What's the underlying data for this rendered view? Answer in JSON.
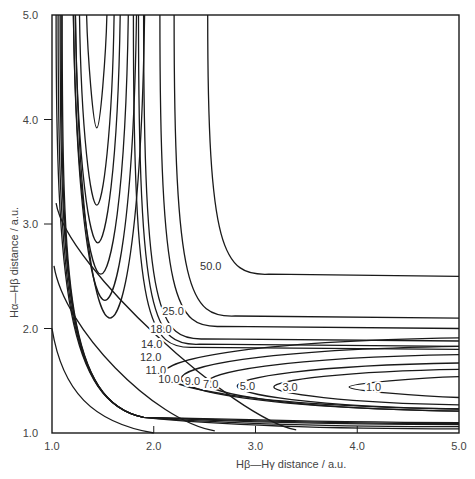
{
  "chart_data": {
    "type": "contour",
    "title": "",
    "xlabel": "Hβ—Hγ distance / a.u.",
    "ylabel": "Hα—Hβ distance / a.u.",
    "xlim": [
      1.0,
      5.0
    ],
    "ylim": [
      1.0,
      5.0
    ],
    "grid": false,
    "legend": "none",
    "x_ticks": [
      "1.0",
      "2.0",
      "3.0",
      "4.0",
      "5.0"
    ],
    "y_ticks": [
      "1.0",
      "2.0",
      "3.0",
      "4.0",
      "5.0"
    ],
    "contour_levels": [
      "1.0",
      "3.0",
      "5.0",
      "7.0",
      "9.0",
      "10.0",
      "11.0",
      "12.0",
      "14.0",
      "18.0",
      "25.0",
      "50.0"
    ],
    "channel_minimum_values": {
      "1.0": {
        "u_bottom": [
          1.44,
          3.92
        ],
        "u_halfwidth_top": 0.1
      },
      "3.0": {
        "u_bottom": [
          1.44,
          3.18
        ],
        "u_halfwidth_top": 0.17
      },
      "5.0": {
        "u_bottom": [
          1.45,
          2.82
        ],
        "u_halfwidth_top": 0.22
      },
      "7.0": {
        "u_bottom": [
          1.48,
          2.52
        ],
        "u_halfwidth_top": 0.27
      },
      "9.0": {
        "u_bottom": [
          1.52,
          2.27
        ],
        "u_halfwidth_top": 0.31
      },
      "10.0": {
        "u_bottom": [
          1.57,
          2.1
        ],
        "u_halfwidth_top": 0.34
      }
    },
    "through_contours": {
      "11.0": {
        "inner_top_x": 1.8,
        "inner_right_y": 1.8,
        "outer_top_x": 1.1,
        "outer_right_y": 1.1
      },
      "12.0": {
        "inner_top_x": 1.85,
        "inner_right_y": 1.83,
        "outer_top_x": 1.09,
        "outer_right_y": 1.09
      },
      "14.0": {
        "inner_top_x": 1.9,
        "inner_right_y": 1.88,
        "outer_top_x": 1.08,
        "outer_right_y": 1.08
      },
      "18.0": {
        "inner_top_x": 2.06,
        "inner_right_y": 2.0,
        "outer_top_x": 1.06,
        "outer_right_y": 1.06
      },
      "25.0": {
        "inner_top_x": 2.2,
        "inner_right_y": 2.1,
        "outer_top_x": 1.04,
        "outer_right_y": 1.04
      },
      "50.0": {
        "inner_top_x": 2.53,
        "inner_right_y": 2.5,
        "outer_top_x": 1.02,
        "outer_right_y": 1.0
      }
    },
    "labels": [
      {
        "text": "50.0",
        "x": 2.56,
        "y": 2.6
      },
      {
        "text": "25.0",
        "x": 2.19,
        "y": 2.17
      },
      {
        "text": "18.0",
        "x": 2.07,
        "y": 2.0
      },
      {
        "text": "14.0",
        "x": 1.98,
        "y": 1.85
      },
      {
        "text": "12.0",
        "x": 1.97,
        "y": 1.73
      },
      {
        "text": "11.0",
        "x": 2.02,
        "y": 1.6
      },
      {
        "text": "10.0",
        "x": 2.15,
        "y": 1.52
      },
      {
        "text": "9.0",
        "x": 2.38,
        "y": 1.5
      },
      {
        "text": "7.0",
        "x": 2.56,
        "y": 1.47
      },
      {
        "text": "5.0",
        "x": 2.92,
        "y": 1.45
      },
      {
        "text": "3.0",
        "x": 3.34,
        "y": 1.44
      },
      {
        "text": "1.0",
        "x": 4.16,
        "y": 1.44
      }
    ]
  }
}
